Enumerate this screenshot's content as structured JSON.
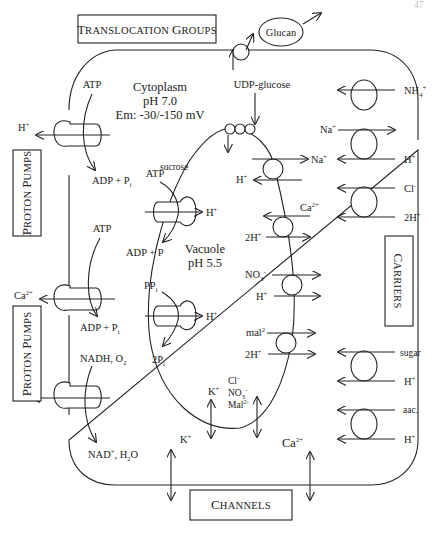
{
  "page_number": "47",
  "boxes": {
    "translocation_groups": {
      "first": "T",
      "rest": "RANSLOCATION ",
      "first2": "G",
      "rest2": "ROUPS"
    },
    "proton_pumps_1": {
      "first": "P",
      "rest": "ROTON ",
      "first2": "P",
      "rest2": "UMPS"
    },
    "proton_pumps_2": {
      "first": "P",
      "rest": "ROTON ",
      "first2": "P",
      "rest2": "UMPS"
    },
    "carriers": {
      "first": "C",
      "rest": "ARRIERS"
    },
    "channels": {
      "first": "C",
      "rest": "HANNELS"
    }
  },
  "cytoplasm": {
    "title": "Cytoplasm",
    "ph": "pH 7.0",
    "em": "Em: -30/-150 mV"
  },
  "vacuole": {
    "title": "Vacuole",
    "ph": "pH 5.5"
  },
  "glucan": {
    "label": "Glucan",
    "substrate": "UDP-glucose",
    "product": "sucrose"
  },
  "plasma_membrane_pumps": [
    {
      "input": "ATP",
      "output": "ADP + P",
      "output_sub": "i",
      "ion": "H",
      "ion_sup": "+"
    },
    {
      "input": "ATP",
      "output": "ADP + P",
      "output_sub": "i",
      "ion": "Ca",
      "ion_sup": "2+"
    },
    {
      "input": "NADH, O",
      "input_sub": "2",
      "output": "NAD",
      "output_sup": "+",
      "output2": ", H",
      "output2_sub": "2",
      "output3": "O",
      "ion": "H",
      "ion_sup": "+"
    }
  ],
  "tonoplast_pumps": [
    {
      "input": "ATP",
      "output": "ADP + P",
      "ion": "H",
      "ion_sup": "+"
    },
    {
      "input": "PP",
      "input_sub": "i",
      "output": "2P",
      "output_sub": "i",
      "ion": "H",
      "ion_sup": "+"
    }
  ],
  "tonoplast_carriers": [
    {
      "top": "Na",
      "top_sup": "+",
      "bottom": "H",
      "bottom_sup": "+"
    },
    {
      "top": "Ca",
      "top_sup": "2+",
      "bottom": "2H",
      "bottom_sup": "+"
    },
    {
      "top": "NO",
      "top_sub": "3",
      "top_sup": "-",
      "bottom": "H",
      "bottom_sup": "+"
    },
    {
      "top": "mal",
      "top_sup": "2",
      "bottom": "2H",
      "bottom_sup": "+"
    }
  ],
  "plasma_carriers": [
    {
      "top": "NH",
      "top_sub": "4",
      "top_sup": "+"
    },
    {
      "top": "Na",
      "top_sup": "+",
      "bottom": "H",
      "bottom_sup": "+"
    },
    {
      "top": "Cl",
      "top_sup": "-",
      "bottom": "2H",
      "bottom_sup": "+"
    },
    {
      "top": "sugar",
      "bottom": "H",
      "bottom_sup": "+"
    },
    {
      "top": "aac.",
      "bottom": "H",
      "bottom_sup": "+"
    }
  ],
  "channels": {
    "tonoplast_k": "K",
    "tonoplast_k_sup": "+",
    "tonoplast_anions": [
      "Cl",
      "NO",
      "Mal"
    ],
    "tonoplast_anions_sup": [
      "-",
      "-",
      "2-"
    ],
    "tonoplast_no_sub": "3",
    "plasma_k": "K",
    "plasma_k_sup": "+",
    "plasma_ca": "Ca",
    "plasma_ca_sup": "2+"
  }
}
